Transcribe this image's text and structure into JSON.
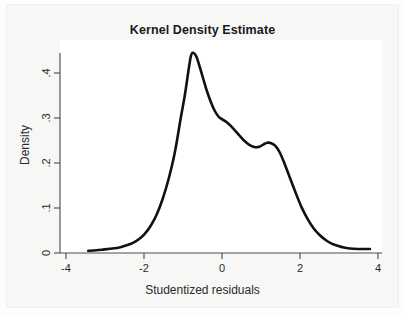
{
  "chart_data": {
    "type": "line",
    "title": "Kernel Density Estimate",
    "xlabel": "Studentized residuals",
    "ylabel": "Density",
    "xlim": [
      -4,
      4
    ],
    "ylim": [
      0,
      0.46
    ],
    "grid": false,
    "legend": "none",
    "xticks": [
      -4,
      -2,
      0,
      2,
      4
    ],
    "xtick_labels": [
      "-4",
      "-2",
      "0",
      "2",
      "4"
    ],
    "yticks": [
      0,
      0.1,
      0.2,
      0.3,
      0.4
    ],
    "ytick_labels": [
      "0",
      ".1",
      ".2",
      ".3",
      ".4"
    ],
    "series": [
      {
        "name": "Kernel density",
        "color": "#111111",
        "x": [
          -3.3,
          -3.1,
          -2.9,
          -2.7,
          -2.5,
          -2.35,
          -2.2,
          -2.05,
          -1.9,
          -1.75,
          -1.6,
          -1.45,
          -1.3,
          -1.15,
          -1.0,
          -0.9,
          -0.8,
          -0.75,
          -0.7,
          -0.62,
          -0.55,
          -0.45,
          -0.35,
          -0.25,
          -0.15,
          -0.05,
          0.05,
          0.15,
          0.25,
          0.35,
          0.45,
          0.55,
          0.65,
          0.75,
          0.85,
          0.95,
          1.05,
          1.15,
          1.25,
          1.35,
          1.45,
          1.55,
          1.7,
          1.85,
          2.0,
          2.15,
          2.3,
          2.45,
          2.6,
          2.75,
          2.9,
          3.05,
          3.2,
          3.4,
          3.6,
          3.7
        ],
        "y": [
          0.005,
          0.006,
          0.008,
          0.01,
          0.013,
          0.017,
          0.022,
          0.03,
          0.042,
          0.06,
          0.085,
          0.12,
          0.165,
          0.222,
          0.3,
          0.35,
          0.41,
          0.437,
          0.445,
          0.438,
          0.42,
          0.39,
          0.36,
          0.335,
          0.315,
          0.302,
          0.296,
          0.29,
          0.282,
          0.272,
          0.262,
          0.252,
          0.244,
          0.238,
          0.235,
          0.236,
          0.241,
          0.245,
          0.244,
          0.238,
          0.225,
          0.205,
          0.17,
          0.135,
          0.102,
          0.076,
          0.055,
          0.04,
          0.029,
          0.021,
          0.016,
          0.012,
          0.01,
          0.009,
          0.009,
          0.009
        ]
      }
    ]
  },
  "axes": {
    "x_tick_labels": [
      "-4",
      "-2",
      "0",
      "2",
      "4"
    ],
    "y_tick_labels": [
      "0",
      ".1",
      ".2",
      ".3",
      ".4"
    ]
  }
}
